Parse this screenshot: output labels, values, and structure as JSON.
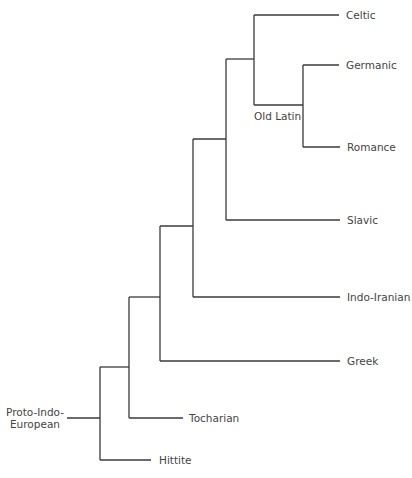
{
  "diagram": {
    "type": "tree",
    "root_label": "Proto-Indo-European",
    "root_label_lines": [
      "Proto-Indo-",
      "European"
    ],
    "internal_labels": {
      "old_latin": "Old Latin"
    },
    "leaves": [
      {
        "id": "celtic",
        "label": "Celtic"
      },
      {
        "id": "germanic",
        "label": "Germanic"
      },
      {
        "id": "romance",
        "label": "Romance"
      },
      {
        "id": "slavic",
        "label": "Slavic"
      },
      {
        "id": "indo_iranian",
        "label": "Indo-Iranian"
      },
      {
        "id": "greek",
        "label": "Greek"
      },
      {
        "id": "tocharian",
        "label": "Tocharian"
      },
      {
        "id": "hittite",
        "label": "Hittite"
      }
    ],
    "structure": "(Hittite, (Tocharian, (Greek, (Indo-Iranian, (Slavic, (Celtic, Old Latin(Germanic, Romance)))))))",
    "line_color": "#3a3a3a",
    "text_color": "#444444"
  }
}
